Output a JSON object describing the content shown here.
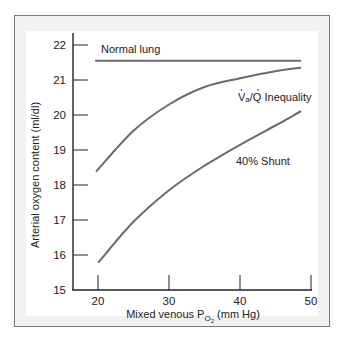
{
  "chart_data": {
    "type": "line",
    "title": "",
    "xlabel": "Mixed venous P_O2 (mm Hg)",
    "xlabel_main": "Mixed venous P",
    "xlabel_sub": "O",
    "xlabel_subsub": "2",
    "xlabel_unit": " (mm Hg)",
    "ylabel": "Arterial oxygen content (ml/dl)",
    "xlim": [
      17,
      50
    ],
    "ylim": [
      15,
      22.3
    ],
    "xticks": [
      20,
      30,
      40,
      50
    ],
    "yticks": [
      15,
      16,
      17,
      18,
      19,
      20,
      21,
      22
    ],
    "grid": false,
    "legend": "inline labels",
    "series": [
      {
        "name": "Normal lung",
        "x": [
          19.7,
          48.5
        ],
        "values": [
          21.55,
          21.55
        ]
      },
      {
        "name": "VA/Q Inequality",
        "label": "V̇A/Q̇ Inequality",
        "x": [
          19.8,
          25,
          30,
          35,
          40,
          45,
          48.5
        ],
        "values": [
          18.4,
          19.55,
          20.3,
          20.8,
          21.05,
          21.25,
          21.35
        ]
      },
      {
        "name": "40% Shunt",
        "x": [
          20.1,
          25,
          30,
          35,
          40,
          45,
          48.5
        ],
        "values": [
          15.8,
          16.95,
          17.85,
          18.55,
          19.15,
          19.7,
          20.1
        ]
      }
    ]
  },
  "labels": {
    "normal": "Normal lung",
    "vq_v": "V",
    "vq_a": "a",
    "vq_rest": "/Q Inequality",
    "shunt": "40% Shunt"
  }
}
